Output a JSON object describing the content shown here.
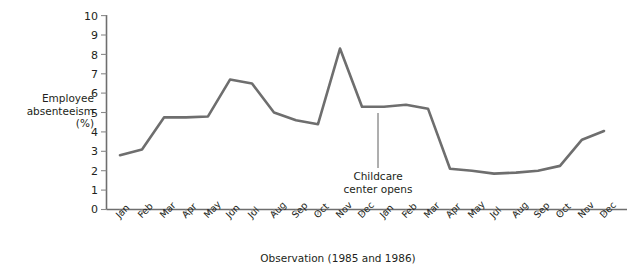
{
  "chart_data": {
    "type": "line",
    "title": "",
    "xlabel": "Observation (1985 and 1986)",
    "ylabel": "Employee absenteeism (%)",
    "ylabel_lines": [
      "Employee",
      "absenteeism",
      "(%)"
    ],
    "ylim": [
      0,
      10
    ],
    "ytick_labels": [
      "0",
      "1",
      "2",
      "3",
      "4",
      "5",
      "6",
      "7",
      "8",
      "9",
      "10"
    ],
    "ytick_values": [
      0,
      1,
      2,
      3,
      4,
      5,
      6,
      7,
      8,
      9,
      10
    ],
    "grid": false,
    "legend": null,
    "line_color": "#6e6e6e",
    "axis_color": "#6e6e6e",
    "categories": [
      "Jan",
      "Feb",
      "Mar",
      "Apr",
      "May",
      "Jun",
      "Jul",
      "Aug",
      "Sep",
      "Oct",
      "Nov",
      "Dec",
      "Jan",
      "Feb",
      "Mar",
      "Apr",
      "May",
      "Jul",
      "Aug",
      "Sep",
      "Oct",
      "Nov",
      "Dec"
    ],
    "values": [
      2.8,
      3.1,
      4.75,
      4.75,
      4.8,
      6.7,
      6.5,
      5.0,
      4.6,
      4.4,
      8.3,
      5.3,
      5.3,
      5.4,
      5.2,
      2.1,
      2.0,
      1.85,
      1.9,
      2.0,
      2.25,
      3.6,
      4.05
    ],
    "annotations": [
      {
        "text": "Childcare center opens",
        "lines": [
          "Childcare",
          "center opens"
        ],
        "target_category_index": 12
      }
    ]
  },
  "axis": {
    "y_title": "Employee\nabsenteeism\n(%)",
    "x_title": "Observation (1985 and 1986)"
  },
  "annotation": {
    "line1": "Childcare",
    "line2": "center opens"
  }
}
